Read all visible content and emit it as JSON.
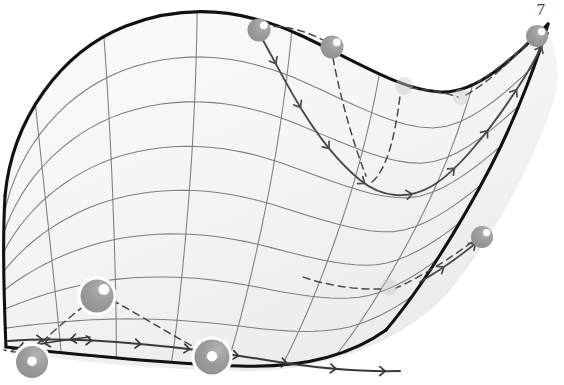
{
  "figure": {
    "page_number_label": "7",
    "caption_text": "",
    "type": "manifold-surface-with-geodesic-flow",
    "colors": {
      "boundary_curve": "#121212",
      "grid_line": "#7a7a7a",
      "surface_fill": "#f4f4f4",
      "surface_fill_edge": "#ededed",
      "trajectory_curve": "#4a4a4a",
      "dashed_connector": "#4a4a4a",
      "sphere_body": "#9a9a9a",
      "sphere_faint": "#c9c9c9",
      "sphere_highlight": "#ffffff",
      "sphere_halo": "#ffffff",
      "page_number": "#3d3d3d",
      "background": "#ffffff"
    },
    "geometry": {
      "width": 564,
      "height": 385,
      "boundary_outline_path": "M 5 196 C 12 120 60 52 126 26 C 190 1 250 12 300 35 C 356 61 400 90 440 92 C 476 94 510 62 546 25 C 556 48 560 70 556 92 C 540 150 500 228 452 288 C 412 337 330 372 246 371 C 160 370 70 362 10 350 C 4 300 2 246 5 196 Z",
      "top_boundary_path": "M 5 196 C 12 120 60 52 126 26 C 190 1 250 12 300 35 C 356 61 400 90 440 92 C 476 94 512 60 548 24",
      "right_boundary_path": "M 548 24 C 540 52 520 110 490 168 C 460 226 420 290 386 330",
      "bottom_boundary_path": "M 386 330 C 350 356 300 368 240 366 C 170 364 90 356 6 347",
      "left_boundary_path": "M 6 347 C 4 300 2 246 5 196",
      "grid_u_count": 7,
      "grid_v_count": 8
    },
    "spheres": [
      {
        "id": "s1",
        "name": "node-top-left",
        "cx": 259,
        "cy": 30,
        "r": 11.5,
        "style": "solid-highlight",
        "halo": false,
        "opacity": 1.0
      },
      {
        "id": "s2",
        "name": "node-top-mid",
        "cx": 332,
        "cy": 47,
        "r": 11.5,
        "style": "solid-highlight",
        "halo": false,
        "opacity": 1.0
      },
      {
        "id": "s3",
        "name": "node-top-right",
        "cx": 537,
        "cy": 36,
        "r": 11.0,
        "style": "solid-highlight",
        "halo": false,
        "opacity": 1.0
      },
      {
        "id": "s4",
        "name": "node-right-mid",
        "cx": 482,
        "cy": 237,
        "r": 11.0,
        "style": "solid-highlight",
        "halo": false,
        "opacity": 1.0
      },
      {
        "id": "s5",
        "name": "node-behind-upper",
        "cx": 404,
        "cy": 86,
        "r": 9.0,
        "style": "faint",
        "halo": false,
        "opacity": 0.45
      },
      {
        "id": "s6",
        "name": "node-behind-lower",
        "cx": 461,
        "cy": 97,
        "r": 8.0,
        "style": "faint",
        "halo": false,
        "opacity": 0.4
      },
      {
        "id": "s7",
        "name": "node-behind-right",
        "cx": 389,
        "cy": 287,
        "r": 8.5,
        "style": "faint",
        "halo": false,
        "opacity": 0.42
      },
      {
        "id": "s8",
        "name": "node-left-upper",
        "cx": 97,
        "cy": 296,
        "r": 16.5,
        "style": "solid-highlight",
        "halo": true,
        "opacity": 1.0
      },
      {
        "id": "s9",
        "name": "node-bottom-left",
        "cx": 32,
        "cy": 362,
        "r": 16.0,
        "style": "donut",
        "halo": true,
        "opacity": 1.0
      },
      {
        "id": "s10",
        "name": "node-bottom-center",
        "cx": 212,
        "cy": 357,
        "r": 17.5,
        "style": "donut",
        "halo": true,
        "opacity": 1.0
      }
    ],
    "trajectories": [
      {
        "id": "t1",
        "name": "geodesic-main-upper",
        "style": "solid",
        "color": "#4a4a4a",
        "width": 1.9,
        "path": "M 259 33 C 272 56 286 84 302 110 C 318 136 338 162 360 180 C 382 198 408 200 432 186 C 456 172 490 132 524 78 C 534 62 542 46 548 33",
        "arrow_count": 9
      },
      {
        "id": "t2",
        "name": "geodesic-lower-sweep",
        "style": "solid",
        "color": "#3a3a3a",
        "width": 2.0,
        "path": "M 8 341 C 50 338 96 340 140 344 C 186 348 230 354 272 361 C 316 368 360 372 400 371",
        "arrow_count": 8
      },
      {
        "id": "t3",
        "name": "geodesic-left-tail",
        "style": "solid",
        "color": "#3a3a3a",
        "width": 1.6,
        "path": "M 90 337 C 62 340 36 344 12 350",
        "arrow_count": 3
      },
      {
        "id": "t4",
        "name": "geodesic-right-arc",
        "style": "solid",
        "color": "#4a4a4a",
        "width": 1.7,
        "path": "M 420 282 C 444 268 466 252 484 236",
        "arrow_count": 2
      }
    ],
    "connectors": [
      {
        "id": "c1",
        "name": "connector-top-left-to-top-mid",
        "path": "M 262 27 C 285 24 310 32 330 44"
      },
      {
        "id": "c2",
        "name": "connector-top-mid-to-curve",
        "path": "M 333 58 C 340 96 352 140 366 176"
      },
      {
        "id": "c3",
        "name": "connector-curve-to-behind",
        "path": "M 372 182 C 384 172 394 146 400 96"
      },
      {
        "id": "c4",
        "name": "connector-behind-to-right",
        "path": "M 410 88 C 432 90 450 94 458 97"
      },
      {
        "id": "c5",
        "name": "connector-behind-right-to-top",
        "path": "M 466 95 C 492 80 516 56 530 40"
      },
      {
        "id": "c6",
        "name": "connector-top-right-to-curve",
        "path": "M 528 42 C 514 56 496 70 478 82"
      },
      {
        "id": "c7",
        "name": "connector-left-upper-to-bottom",
        "path": "M 84 306 C 66 320 48 336 36 348"
      },
      {
        "id": "c8",
        "name": "connector-left-upper-to-center",
        "path": "M 112 300 C 148 320 180 340 200 350"
      },
      {
        "id": "c9",
        "name": "connector-bottom-left-tail",
        "path": "M 18 352 C 12 352 8 351 4 350"
      },
      {
        "id": "c10",
        "name": "connector-right-mid-to-behind",
        "path": "M 472 242 C 440 266 410 282 396 288"
      },
      {
        "id": "c11",
        "name": "connector-behind-right-to-left",
        "path": "M 381 289 C 352 290 322 284 300 276"
      }
    ]
  }
}
